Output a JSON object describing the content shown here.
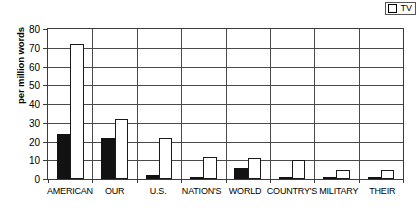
{
  "legend": {
    "entries": [
      {
        "label": "TV",
        "marker": "open-square",
        "color": "#ffffff"
      }
    ]
  },
  "axis": {
    "ylabel": "per million words",
    "yticks": [
      0,
      10,
      20,
      30,
      40,
      50,
      60,
      70,
      80
    ]
  },
  "chart_data": {
    "type": "bar",
    "title": "",
    "subtitle": "",
    "xlabel": "",
    "ylabel": "per million words",
    "ylim": [
      0,
      80
    ],
    "ytick_step": 10,
    "grid": true,
    "legend_position": "top-right",
    "categories": [
      "AMERICAN",
      "OUR",
      "U.S.",
      "NATION'S",
      "WORLD",
      "COUNTRY'S",
      "MILITARY",
      "THEIR"
    ],
    "series": [
      {
        "name": "",
        "color": "#121212",
        "style": "filled-black",
        "values": [
          24,
          22,
          2,
          0.5,
          6,
          0.5,
          0.5,
          1
        ]
      },
      {
        "name": "TV",
        "color": "#ffffff",
        "style": "open-outline",
        "values": [
          72,
          32,
          22,
          12,
          11,
          10,
          5,
          5
        ]
      }
    ]
  }
}
